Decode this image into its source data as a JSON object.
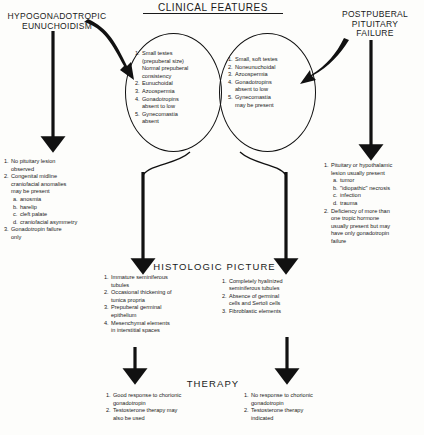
{
  "diagram": {
    "title": "CLINICAL FEATURES",
    "sections": {
      "histologic": "HISTOLOGIC  PICTURE",
      "therapy": "THERAPY"
    },
    "left_heading": [
      "HYPOGONADOTROPIC",
      "EUNUCHOIDISM"
    ],
    "right_heading": [
      "POSTPUBERAL",
      "PITUITARY",
      "FAILURE"
    ],
    "left_circle": [
      {
        "n": "1.",
        "t": "Small testes",
        "cont": [
          "(prepuberal  size)",
          "Normal  prepuberal",
          "consistency"
        ]
      },
      {
        "n": "2.",
        "t": "Eunuchoidal"
      },
      {
        "n": "3.",
        "t": "Azoospermia"
      },
      {
        "n": "4.",
        "t": "Gonadotropins",
        "cont": [
          "absent  to  low"
        ]
      },
      {
        "n": "5.",
        "t": "Gynecomastia",
        "cont": [
          "absent"
        ]
      }
    ],
    "right_circle": [
      {
        "n": "1.",
        "t": "Small, soft testes"
      },
      {
        "n": "2.",
        "t": "Noneunuchoidal"
      },
      {
        "n": "3.",
        "t": "Azoospermia"
      },
      {
        "n": "4.",
        "t": "Gonadotropins",
        "cont": [
          "absent  to low"
        ]
      },
      {
        "n": "5.",
        "t": "Gynecomastia",
        "cont": [
          "may  be present"
        ]
      }
    ],
    "left_findings": [
      {
        "n": "1.",
        "t": "No pituitary lesion",
        "cont": [
          "observed"
        ]
      },
      {
        "n": "2.",
        "t": "Congenital  midline",
        "cont": [
          "craniofacial  anomalies",
          "may  be present"
        ],
        "subs": [
          {
            "n": "a.",
            "t": "anosmia"
          },
          {
            "n": "b.",
            "t": "harelip"
          },
          {
            "n": "c.",
            "t": "cleft  palate"
          },
          {
            "n": "d.",
            "t": "craniofacial  asymmetry"
          }
        ]
      },
      {
        "n": "3.",
        "t": "Gonadotropin   failure",
        "cont": [
          "only"
        ]
      }
    ],
    "right_findings": [
      {
        "n": "1.",
        "t": "Pituitary or hypothalamic",
        "cont": [
          "lesion usually present"
        ],
        "subs": [
          {
            "n": "a.",
            "t": "tumor"
          },
          {
            "n": "b.",
            "t": "\"idiopathic\"  necrosis"
          },
          {
            "n": "c.",
            "t": "infection"
          },
          {
            "n": "d.",
            "t": "trauma"
          }
        ]
      },
      {
        "n": "2.",
        "t": "Deficiency of more than",
        "cont": [
          "one tropic  hormone",
          "usually  present but may",
          "have  only  gonadotropin",
          "failure"
        ]
      }
    ],
    "left_histologic": [
      {
        "n": "1.",
        "t": "Immature  seminiferous",
        "cont": [
          "tubules"
        ]
      },
      {
        "n": "2.",
        "t": "Occasional  thickening of",
        "cont": [
          "tunica  propria"
        ]
      },
      {
        "n": "3.",
        "t": "Prepuberal  germinal",
        "cont": [
          "epithelium"
        ]
      },
      {
        "n": "4.",
        "t": "Mesenchymal   elements",
        "cont": [
          "in  interstitial  spaces"
        ]
      }
    ],
    "right_histologic": [
      {
        "n": "1.",
        "t": "Completely  hyalinized",
        "cont": [
          "seminiferous  tubules"
        ]
      },
      {
        "n": "2.",
        "t": "Absence of  germinal",
        "cont": [
          "cells  and Sertoli cells"
        ]
      },
      {
        "n": "3.",
        "t": "Fibroblastic  elements"
      }
    ],
    "left_therapy": [
      {
        "n": "1.",
        "t": "Good response  to chorionic",
        "cont": [
          "gonadotropin"
        ]
      },
      {
        "n": "2.",
        "t": "Testosterone  therapy may",
        "cont": [
          "also  be used"
        ]
      }
    ],
    "right_therapy": [
      {
        "n": "1.",
        "t": "No response  to chorionic",
        "cont": [
          "gonadotropin"
        ]
      },
      {
        "n": "2.",
        "t": "Testosterone   therapy",
        "cont": [
          "indicated"
        ]
      }
    ],
    "colors": {
      "ink": "#1a1a1a",
      "paper": "#fdfdfb"
    }
  }
}
